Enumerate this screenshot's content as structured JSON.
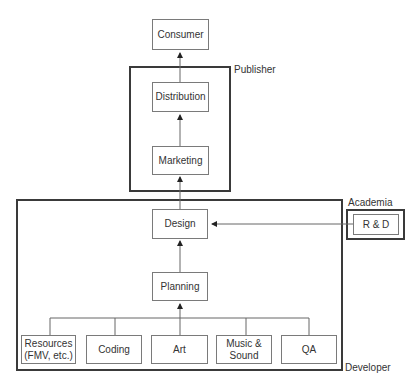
{
  "diagram": {
    "type": "flow-hierarchy",
    "nodes": {
      "consumer": "Consumer",
      "distribution": "Distribution",
      "marketing": "Marketing",
      "design": "Design",
      "rnd": "R & D",
      "planning": "Planning",
      "resources": "Resources\n(FMV, etc.)",
      "coding": "Coding",
      "art": "Art",
      "music_sound": "Music &\nSound",
      "qa": "QA"
    },
    "groups": {
      "publisher": "Publisher",
      "academia": "Academia",
      "developer": "Developer"
    },
    "edges": [
      {
        "from": "distribution",
        "to": "consumer"
      },
      {
        "from": "marketing",
        "to": "distribution"
      },
      {
        "from": "design",
        "to": "marketing"
      },
      {
        "from": "rnd",
        "to": "design"
      },
      {
        "from": "planning",
        "to": "design"
      },
      {
        "from": [
          "resources",
          "coding",
          "art",
          "music_sound",
          "qa"
        ],
        "to": "planning"
      }
    ],
    "colors": {
      "frame": "#3a3a3a",
      "box_border": "#7a7a7a",
      "line": "#666666",
      "text": "#333333"
    }
  }
}
